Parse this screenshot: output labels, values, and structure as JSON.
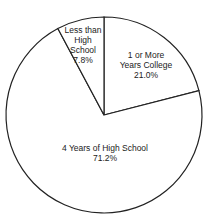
{
  "chart_data": {
    "type": "pie",
    "title": "",
    "categories": [
      "1 or More Years College",
      "4 Years of High School",
      "Less than High School"
    ],
    "values": [
      21.0,
      71.2,
      7.8
    ],
    "unit": "%",
    "start_angle_deg": 0,
    "direction": "clockwise",
    "colors": {
      "fill": "#ffffff",
      "stroke": "#222222"
    },
    "legend": "none (labels inside slices)"
  },
  "labels": {
    "college": {
      "line1": "1 or More",
      "line2": "Years College",
      "value": "21.0%"
    },
    "highschool": {
      "line1": "4 Years of High School",
      "value": "71.2%"
    },
    "less": {
      "line1": "Less than",
      "line2": "High",
      "line3": "School",
      "value": "7.8%"
    }
  }
}
